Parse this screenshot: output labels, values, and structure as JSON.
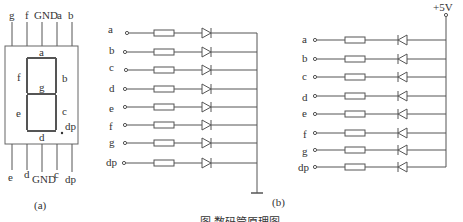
{
  "figure": {
    "caption": "图  数码管原理图",
    "panel_a": {
      "label": "(a)",
      "top_pins": [
        "g",
        "f",
        "GND",
        "a",
        "b"
      ],
      "bottom_pins": [
        "e",
        "d",
        "GND",
        "c",
        "dp"
      ],
      "segments": [
        "a",
        "b",
        "c",
        "d",
        "e",
        "f",
        "g",
        "dp"
      ]
    },
    "panel_b_cathode": {
      "label": "(b)",
      "inputs": [
        "a",
        "b",
        "c",
        "d",
        "e",
        "f",
        "g",
        "dp"
      ],
      "common": "GND"
    },
    "panel_b_anode": {
      "supply": "+5V",
      "inputs": [
        "a",
        "b",
        "c",
        "d",
        "e",
        "f",
        "g",
        "dp"
      ]
    }
  }
}
